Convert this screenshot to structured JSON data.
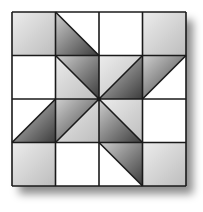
{
  "diagram": {
    "type": "quilt-block",
    "rows": 4,
    "cols": 4,
    "origin": [
      12,
      12
    ],
    "cell_size": 43.5,
    "colors": {
      "white": "#ffffff",
      "line": "#1a1a1a",
      "light_gray_start": "#ececec",
      "light_gray_end": "#bdbdbd",
      "dark_gray_start": "#cfcfcf",
      "dark_gray_end": "#3c3c3c",
      "shadow": "#000000"
    },
    "cells": [
      [
        {
          "kind": "square",
          "fill": "light"
        },
        {
          "kind": "tri",
          "diag": "tlbr",
          "a": "white",
          "b": "dark"
        },
        {
          "kind": "square",
          "fill": "white"
        },
        {
          "kind": "square",
          "fill": "light"
        }
      ],
      [
        {
          "kind": "square",
          "fill": "white"
        },
        {
          "kind": "tri",
          "diag": "tlbr",
          "a": "dark",
          "b": "light"
        },
        {
          "kind": "tri",
          "diag": "bltr",
          "a": "light",
          "b": "dark"
        },
        {
          "kind": "tri",
          "diag": "bltr",
          "a": "dark",
          "b": "white"
        }
      ],
      [
        {
          "kind": "tri",
          "diag": "bltr",
          "a": "white",
          "b": "dark"
        },
        {
          "kind": "tri",
          "diag": "bltr",
          "a": "dark",
          "b": "light"
        },
        {
          "kind": "tri",
          "diag": "tlbr",
          "a": "light",
          "b": "dark"
        },
        {
          "kind": "square",
          "fill": "white"
        }
      ],
      [
        {
          "kind": "square",
          "fill": "light"
        },
        {
          "kind": "square",
          "fill": "white"
        },
        {
          "kind": "tri",
          "diag": "tlbr",
          "a": "dark",
          "b": "white"
        },
        {
          "kind": "square",
          "fill": "light"
        }
      ]
    ]
  }
}
